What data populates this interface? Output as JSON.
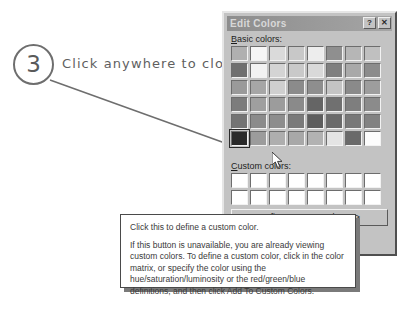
{
  "callout": {
    "number": "3",
    "text": "Click anywhere to close"
  },
  "dialog": {
    "title": "Edit Colors",
    "help_button_label": "?",
    "close_button_label": "✕",
    "basic_colors_label": "Basic colors:",
    "basic_colors_accel": "B",
    "custom_colors_label": "Custom colors:",
    "custom_colors_accel": "C",
    "define_button_label": "Define Custom Colors >>",
    "basic_colors": [
      [
        "#b0b0b0",
        "#f6f6f6",
        "#dadada",
        "#c8c8c8",
        "#ededed",
        "#8f8f8f",
        "#b6b6b6",
        "#c0c0c0"
      ],
      [
        "#6f6f6f",
        "#f2f2f2",
        "#d4d4d4",
        "#c9c9c9",
        "#d9d9d9",
        "#7f7f7f",
        "#a9a9a9",
        "#8c8c8c"
      ],
      [
        "#9a9a9a",
        "#a6a6a6",
        "#cfcfcf",
        "#8b8b8b",
        "#8e8e8e",
        "#c4c4c4",
        "#8a8a8a",
        "#9d9d9d"
      ],
      [
        "#7c7c7c",
        "#9f9f9f",
        "#9c9c9c",
        "#8a8a8a",
        "#656565",
        "#707070",
        "#7e7e7e",
        "#8b8b8b"
      ],
      [
        "#747474",
        "#8b8b8b",
        "#8d8d8d",
        "#7a7a7a",
        "#5d5d5d",
        "#6a6a6a",
        "#787878",
        "#828282"
      ],
      [
        "#2a2a2a",
        "#9c9c9c",
        "#aeaeae",
        "#a8a8a8",
        "#b2b2b2",
        "#e4e4e4",
        "#6a6a6a",
        "#fcfcfc"
      ]
    ],
    "selected_basic_index": 40,
    "custom_colors": [
      [
        "#ffffff",
        "#ffffff",
        "#ffffff",
        "#ffffff",
        "#ffffff",
        "#ffffff",
        "#ffffff",
        "#ffffff"
      ],
      [
        "#ffffff",
        "#ffffff",
        "#ffffff",
        "#ffffff",
        "#ffffff",
        "#ffffff",
        "#ffffff",
        "#ffffff"
      ]
    ]
  },
  "tooltip": {
    "line_1": "Click this to define a custom color.",
    "line_2": "If this button is unavailable, you are already viewing custom colors. To define a custom color, click in the color matrix, or specify the color using the hue/saturation/luminosity or the red/green/blue definitions, and then click Add To Custom Colors."
  }
}
